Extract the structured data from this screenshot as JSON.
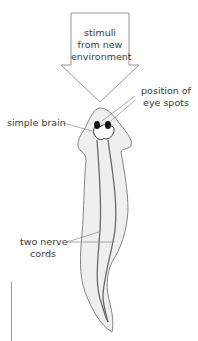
{
  "figure": {
    "arrow_label": [
      "stimuli",
      "from new",
      "environment"
    ],
    "labels": {
      "eye_spots": [
        "position of",
        "eye spots"
      ],
      "brain": "simple brain",
      "nerve_cords": [
        "two nerve",
        "cords"
      ]
    },
    "colors": {
      "outline": "#777777",
      "body_fill": "#efefef",
      "nerve": "#6a6a6a",
      "eye": "#111111",
      "text": "#3a3a3a",
      "leader": "#888888"
    },
    "scale_bar": "vertical line, no text label"
  }
}
